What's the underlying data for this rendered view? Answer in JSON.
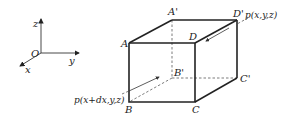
{
  "diagram": {
    "type": "cube-element-flux",
    "axes": {
      "origin_label": "O",
      "x_label": "x",
      "y_label": "y",
      "z_label": "z"
    },
    "vertices": {
      "A": "A",
      "A_prime": "A'",
      "B": "B",
      "B_prime": "B'",
      "C": "C",
      "C_prime": "C'",
      "D": "D",
      "D_prime": "D'"
    },
    "annotations": {
      "p_front": "p(x+dx,y,z)",
      "p_back": "p(x,y,z)"
    },
    "colors": {
      "line": "#222222",
      "background": "#ffffff"
    }
  }
}
